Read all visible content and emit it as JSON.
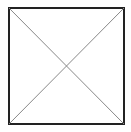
{
  "diagram": {
    "shape": "square-with-diagonals",
    "square": {
      "x": 9,
      "y": 8,
      "width": 115,
      "height": 116,
      "stroke": "#222222",
      "stroke_width": 2
    },
    "diagonals": [
      {
        "x1": 9,
        "y1": 8,
        "x2": 124,
        "y2": 124
      },
      {
        "x1": 124,
        "y1": 8,
        "x2": 9,
        "y2": 124
      }
    ],
    "diagonal_color": "#888888",
    "background": "#ffffff"
  }
}
